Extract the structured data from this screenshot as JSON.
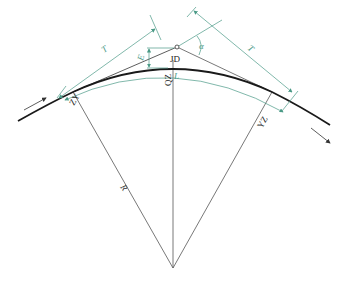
{
  "diagram": {
    "type": "horizontal circular curve geometry",
    "colors": {
      "curve": "#1a1a1a",
      "construction": "#555555",
      "dimension": "#4a9a86",
      "background": "#ffffff"
    },
    "labels": {
      "intersection_point": "JD",
      "curve_start": "ZY",
      "curve_mid": "QZ",
      "curve_end": "YZ",
      "tangent_length_left": "T",
      "tangent_length_right": "T",
      "external_distance": "E",
      "curve_length": "L",
      "deflection_angle": "α",
      "radius": "R"
    }
  }
}
